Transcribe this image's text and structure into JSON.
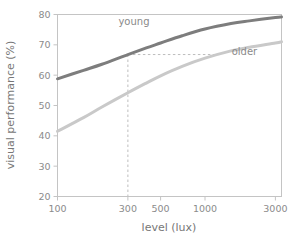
{
  "chart_data": {
    "type": "line",
    "title": "",
    "xlabel": "level (lux)",
    "ylabel": "visual performance (%)",
    "xscale": "log",
    "xlim": [
      100,
      3300
    ],
    "ylim": [
      20,
      80
    ],
    "xticks": [
      100,
      300,
      500,
      1000,
      3000
    ],
    "xtick_labels": [
      "100",
      "300",
      "500",
      "1000",
      "3000"
    ],
    "yticks": [
      20,
      30,
      40,
      50,
      60,
      70,
      80
    ],
    "ytick_labels": [
      "20",
      "30",
      "40",
      "50",
      "60",
      "70",
      "80"
    ],
    "grid": false,
    "legend_position": "inline-annotation",
    "series": [
      {
        "name": "young",
        "label": "young",
        "color": "#7d7d7d",
        "linewidth": 3,
        "x": [
          100,
          150,
          200,
          300,
          400,
          500,
          700,
          1000,
          1500,
          2000,
          3000,
          3300
        ],
        "values": [
          58.8,
          61.6,
          63.6,
          66.8,
          69.0,
          70.6,
          73.0,
          75.2,
          77.0,
          77.9,
          79.0,
          79.2
        ]
      },
      {
        "name": "older",
        "label": "older",
        "color": "#c9c9c9",
        "linewidth": 3,
        "x": [
          100,
          150,
          200,
          300,
          400,
          500,
          700,
          1000,
          1500,
          2000,
          3000,
          3300
        ],
        "values": [
          41.5,
          46.0,
          49.5,
          54.2,
          57.4,
          59.8,
          62.9,
          65.6,
          68.0,
          69.2,
          70.6,
          71.0
        ]
      }
    ],
    "annotations": [
      {
        "name": "reference-lines",
        "type": "dashed-guide",
        "color": "#bdbdbd",
        "x_value": 300,
        "y_value": 66.8,
        "x_end": 1320,
        "description": "vertical dashed line at 300 lux meeting young curve at 66.8%, horizontal dashed line extending right to the older curve"
      }
    ],
    "series_labels": [
      {
        "text": "young",
        "x_value": 330,
        "y_value": 76.5
      },
      {
        "text": "older",
        "x_value": 1850,
        "y_value": 66.5
      }
    ],
    "colors": {
      "frame": "#c4c4c4",
      "tick_text": "#8b8b8b",
      "axis_title": "#777777",
      "background": "#ffffff",
      "young": "#7d7d7d",
      "older": "#c9c9c9",
      "guide": "#bdbdbd"
    }
  }
}
